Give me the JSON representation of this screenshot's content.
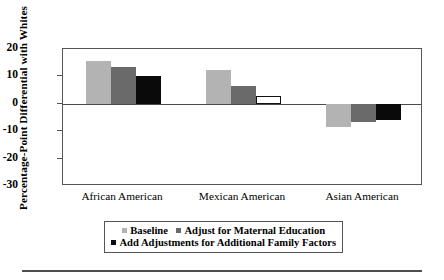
{
  "chart_data": {
    "type": "bar",
    "title": "",
    "subtitle": "",
    "xlabel": "",
    "ylabel": "Percentage-Point Differential with Whites",
    "categories": [
      "African American",
      "Mexican American",
      "Asian American"
    ],
    "series": [
      {
        "name": "Baseline",
        "style": "light-gray-filled",
        "color": "#b3b3b3",
        "values": [
          15.8,
          12.4,
          -8.4
        ]
      },
      {
        "name": "Adjust for Maternal Education",
        "style": "dark-gray-filled",
        "color": "#6a6a6a",
        "values": [
          13.6,
          6.6,
          -6.8
        ]
      },
      {
        "name": "Add Adjustments for Additional Family Factors",
        "style": "black-filled",
        "color": "#0a0a0a",
        "values": [
          10.0,
          3.0,
          -6.0
        ],
        "value_styles": [
          "filled",
          "hollow-outlined",
          "filled"
        ]
      }
    ],
    "ylim": [
      -30,
      20
    ],
    "yticks": [
      20,
      10,
      0,
      -10,
      -20,
      -30
    ],
    "ytick_labels": [
      "20",
      "10",
      "0",
      "-10",
      "-20",
      "-30"
    ],
    "grid": false,
    "zero_line": true,
    "legend_position": "bottom",
    "frame": "box"
  },
  "axis": {
    "y_title": "Percentage-Point Differential with Whites",
    "ticks": [
      {
        "label": "20",
        "value": 20
      },
      {
        "label": "10",
        "value": 10
      },
      {
        "label": "0",
        "value": 0
      },
      {
        "label": "-10",
        "value": -10
      },
      {
        "label": "-20",
        "value": -20
      },
      {
        "label": "-30",
        "value": -30
      }
    ]
  },
  "categories": [
    {
      "label": "African American"
    },
    {
      "label": "Mexican American"
    },
    {
      "label": "Asian American"
    }
  ],
  "legend": {
    "row1": [
      {
        "label": "Baseline",
        "swatch": "light"
      },
      {
        "label": "Adjust for Maternal Education",
        "swatch": "mid"
      }
    ],
    "row2": [
      {
        "label": "Add Adjustments for Additional Family Factors",
        "swatch": "dark"
      }
    ]
  },
  "colors": {
    "baseline": "#b3b3b3",
    "maternal_education": "#6a6a6a",
    "family_factors": "#0a0a0a",
    "frame": "#555555",
    "background": "#ffffff"
  }
}
